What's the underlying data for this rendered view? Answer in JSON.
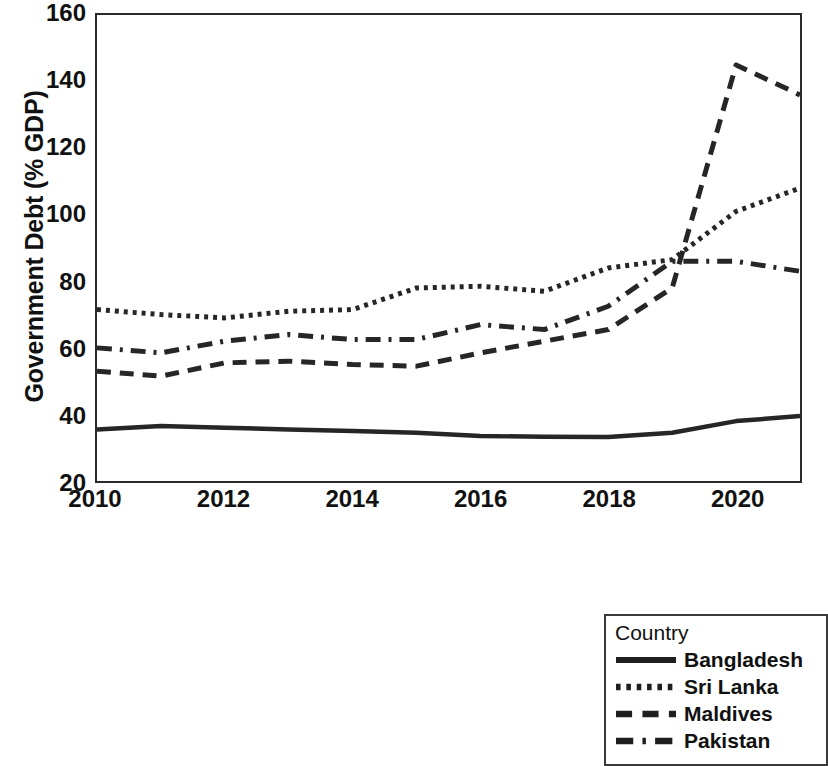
{
  "chart_data": {
    "type": "line",
    "title": "",
    "xlabel": "",
    "ylabel": "Government Debt (% GDP)",
    "xlim": [
      2010,
      2021
    ],
    "ylim": [
      20,
      160
    ],
    "ytick_labels": [
      "20",
      "40",
      "60",
      "80",
      "100",
      "120",
      "140",
      "160"
    ],
    "ytick_values": [
      20,
      40,
      60,
      80,
      100,
      120,
      140,
      160
    ],
    "xtick_labels": [
      "2010",
      "2012",
      "2014",
      "2016",
      "2018",
      "2020"
    ],
    "xtick_values": [
      2010,
      2012,
      2014,
      2016,
      2018,
      2020
    ],
    "grid": false,
    "legend_position": "below-right",
    "legend_title": "Country",
    "x": [
      2010,
      2011,
      2012,
      2013,
      2014,
      2015,
      2016,
      2017,
      2018,
      2019,
      2020,
      2021
    ],
    "series": [
      {
        "name": "Bangladesh",
        "style": "solid",
        "color": "#262626",
        "values": [
          35.5,
          36.5,
          36.0,
          35.5,
          35.0,
          34.5,
          33.5,
          33.3,
          33.2,
          34.5,
          38.0,
          39.5
        ]
      },
      {
        "name": "Sri Lanka",
        "style": "dotted",
        "color": "#262626",
        "values": [
          71.5,
          70.0,
          69.0,
          71.0,
          71.5,
          78.0,
          78.5,
          77.0,
          84.0,
          86.5,
          101.0,
          108.0
        ]
      },
      {
        "name": "Maldives",
        "style": "dashed",
        "color": "#262626",
        "values": [
          53.0,
          51.5,
          55.5,
          56.0,
          55.0,
          54.5,
          58.5,
          62.0,
          65.5,
          78.0,
          145.0,
          136.0
        ]
      },
      {
        "name": "Pakistan",
        "style": "dashdot",
        "color": "#262626",
        "values": [
          60.0,
          58.5,
          62.0,
          64.0,
          62.5,
          62.5,
          67.0,
          65.5,
          72.5,
          86.0,
          86.0,
          83.0
        ]
      }
    ]
  },
  "axes": {
    "y_title": "Government Debt (% GDP)"
  },
  "legend": {
    "title": "Country",
    "entries": [
      {
        "label": "Bangladesh",
        "style": "solid"
      },
      {
        "label": "Sri Lanka",
        "style": "dotted"
      },
      {
        "label": "Maldives",
        "style": "dashed"
      },
      {
        "label": "Pakistan",
        "style": "dashdot"
      }
    ]
  }
}
